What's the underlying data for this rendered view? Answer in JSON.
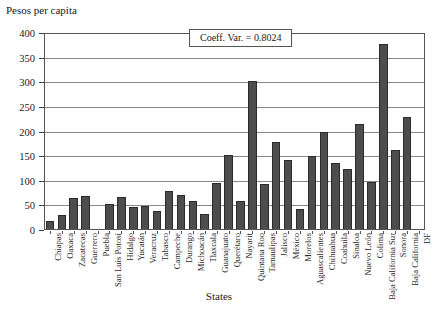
{
  "chart_data": {
    "type": "bar",
    "title": "",
    "ylabel": "Pesos per capita",
    "xlabel": "States",
    "ylim": [
      0,
      400
    ],
    "yticks": [
      0,
      50,
      100,
      150,
      200,
      250,
      300,
      350,
      400
    ],
    "grid": true,
    "legend": null,
    "annotation": "Coeff. Var. = 0.8024",
    "bar_color": "#4d4d4d",
    "categories": [
      "Chiapas",
      "Oaxaca",
      "Zacatecas",
      "Guerrero",
      "Puebla",
      "San Luis Potosí",
      "Hidalgo",
      "Yucatán",
      "Veracruz",
      "Tabasco",
      "Campeche",
      "Durango",
      "Michoacán",
      "Tlaxcala",
      "Guanajuato",
      "Querétaro",
      "Nayarit",
      "Quintana Roo",
      "Tamaulipas",
      "Jalisco",
      "México",
      "Morelos",
      "Aguascalientes",
      "Chihuahua",
      "Coahuila",
      "Sinaloa",
      "Nuevo León",
      "Colima",
      "Baja California Sur",
      "Sonora",
      "Baja California",
      "DF"
    ],
    "values": [
      19,
      30,
      65,
      70,
      0,
      52,
      67,
      47,
      48,
      39,
      80,
      72,
      58,
      32,
      95,
      152,
      58,
      302,
      93,
      178,
      143,
      42,
      150,
      200,
      137,
      123,
      215,
      97,
      378,
      163,
      230,
      0
    ]
  }
}
